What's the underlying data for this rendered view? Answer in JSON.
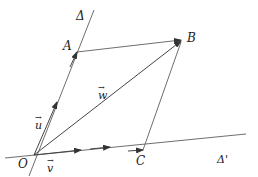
{
  "diagram": {
    "type": "vector-parallelogram",
    "lines": [
      {
        "name": "Δ",
        "label": "Δ"
      },
      {
        "name": "Δ'",
        "label": "Δ'"
      }
    ],
    "points": {
      "O": {
        "label": "O",
        "x": 34,
        "y": 155
      },
      "A": {
        "label": "A",
        "x": 77,
        "y": 52
      },
      "B": {
        "label": "B",
        "x": 183,
        "y": 40
      },
      "C": {
        "label": "C",
        "x": 143,
        "y": 150
      }
    },
    "vectors": [
      {
        "name": "u",
        "label": "u",
        "arrow": "→",
        "from": "O",
        "along": "Δ"
      },
      {
        "name": "v",
        "label": "v",
        "arrow": "→",
        "from": "O",
        "along": "Δ'"
      },
      {
        "name": "w",
        "label": "w",
        "arrow": "→",
        "from": "O",
        "to": "B"
      }
    ],
    "labels": {
      "delta": "Δ",
      "delta_prime": "Δ'",
      "O": "O",
      "A": "A",
      "B": "B",
      "C": "C",
      "u": "u",
      "v": "v",
      "w": "w",
      "arrow": "→"
    },
    "colors": {
      "line": "#6e6e6e",
      "arrow": "#333333",
      "text": "#222222"
    }
  }
}
